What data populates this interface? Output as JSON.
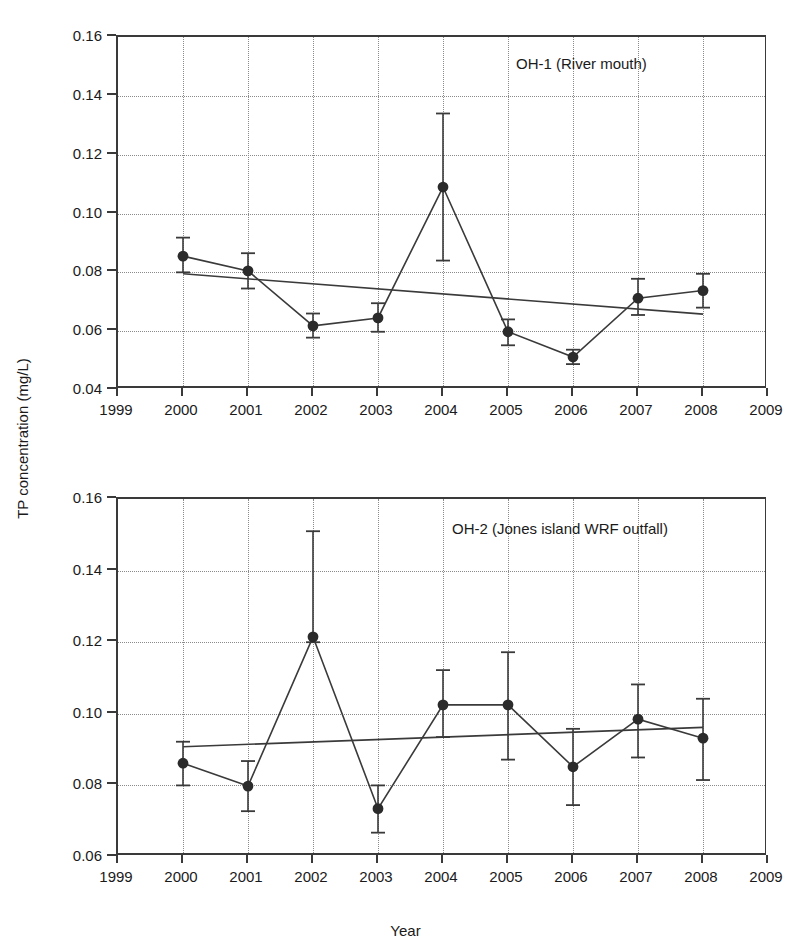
{
  "figure": {
    "y_axis_title": "TP concentration (mg/L)",
    "x_axis_title": "Year"
  },
  "chart_data": [
    {
      "type": "line",
      "panel_id": "top",
      "title": "OH-1 (River mouth)",
      "xlabel": "",
      "ylabel": "TP concentration (mg/L)",
      "xlim": [
        1999,
        2009
      ],
      "ylim": [
        0.04,
        0.16
      ],
      "ytick_labels": [
        "0.16",
        "0.14",
        "0.12",
        "0.10",
        "0.08",
        "0.06",
        "0.04"
      ],
      "ytick_values": [
        0.16,
        0.14,
        0.12,
        0.1,
        0.08,
        0.06,
        0.04
      ],
      "xtick_labels": [
        "1999",
        "2000",
        "2001",
        "2002",
        "2003",
        "2004",
        "2005",
        "2006",
        "2007",
        "2008",
        "2009"
      ],
      "xtick_values": [
        1999,
        2000,
        2001,
        2002,
        2003,
        2004,
        2005,
        2006,
        2007,
        2008,
        2009
      ],
      "grid": true,
      "legend": "none",
      "x": [
        2000,
        2001,
        2002,
        2003,
        2004,
        2005,
        2006,
        2007,
        2008
      ],
      "values": [
        0.0855,
        0.0805,
        0.0618,
        0.0645,
        0.109,
        0.0598,
        0.0512,
        0.0712,
        0.0738
      ],
      "error_low": [
        0.08,
        0.0745,
        0.0578,
        0.0598,
        0.084,
        0.0552,
        0.0488,
        0.0655,
        0.068
      ],
      "error_high": [
        0.0918,
        0.0865,
        0.066,
        0.0695,
        0.134,
        0.064,
        0.0537,
        0.0778,
        0.0795
      ],
      "trendline": {
        "x": [
          2000,
          2008
        ],
        "y": [
          0.0795,
          0.0658
        ],
        "direction": "decreasing"
      }
    },
    {
      "type": "line",
      "panel_id": "bottom",
      "title": "OH-2 (Jones island WRF outfall)",
      "xlabel": "Year",
      "ylabel": "TP concentration (mg/L)",
      "xlim": [
        1999,
        2009
      ],
      "ylim": [
        0.06,
        0.16
      ],
      "ytick_labels": [
        "0.16",
        "0.14",
        "0.12",
        "0.10",
        "0.08",
        "0.06"
      ],
      "ytick_values": [
        0.16,
        0.14,
        0.12,
        0.1,
        0.08,
        0.06
      ],
      "xtick_labels": [
        "1999",
        "2000",
        "2001",
        "2002",
        "2003",
        "2004",
        "2005",
        "2006",
        "2007",
        "2008",
        "2009"
      ],
      "xtick_values": [
        1999,
        2000,
        2001,
        2002,
        2003,
        2004,
        2005,
        2006,
        2007,
        2008,
        2009
      ],
      "grid": true,
      "legend": "none",
      "x": [
        2000,
        2001,
        2002,
        2003,
        2004,
        2005,
        2006,
        2007,
        2008
      ],
      "values": [
        0.0862,
        0.0798,
        0.1215,
        0.0735,
        0.1025,
        0.1025,
        0.0852,
        0.0985,
        0.0932
      ],
      "error_low": [
        0.08,
        0.0728,
        0.12,
        0.0668,
        0.0935,
        0.0872,
        0.0745,
        0.0878,
        0.0815
      ],
      "error_high": [
        0.0922,
        0.0868,
        0.151,
        0.08,
        0.1122,
        0.1172,
        0.0958,
        0.1082,
        0.1042
      ],
      "trendline": {
        "x": [
          2000,
          2008
        ],
        "y": [
          0.0908,
          0.0962
        ],
        "direction": "increasing"
      }
    }
  ],
  "style": {
    "marker_color": "#2b2b2b",
    "line_color": "#3a3a3a",
    "grid_color": "#8a8a8a",
    "axis_color": "#3a3a3a"
  }
}
